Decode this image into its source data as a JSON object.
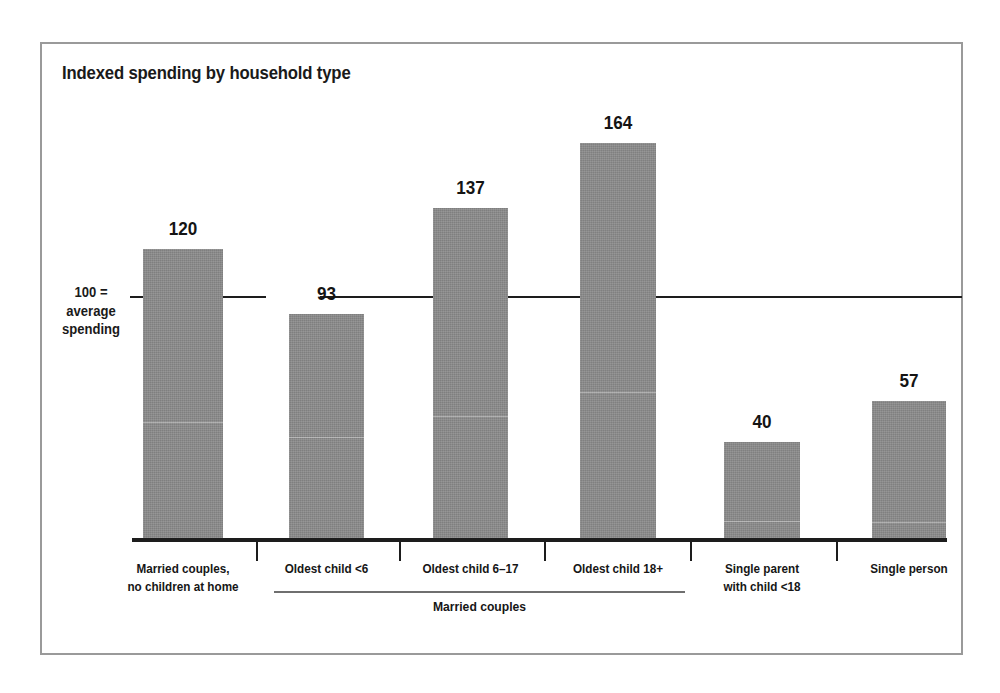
{
  "figure": {
    "title": "Indexed spending by household type",
    "frame_color": "#9a9a9a",
    "background": "#ffffff"
  },
  "axis": {
    "reference_label_line1": "100 =",
    "reference_label_line2": "average",
    "reference_label_line3": "spending",
    "reference_value": 100,
    "baseline_color": "#1d1d1d"
  },
  "group": {
    "label": "Married couples",
    "covers": [
      "Oldest child <6",
      "Oldest child 6–17",
      "Oldest child 18+"
    ]
  },
  "chart_data": {
    "type": "bar",
    "title": "Indexed spending by household type",
    "xlabel": "",
    "ylabel": "",
    "ylim": [
      0,
      175
    ],
    "grid": false,
    "legend": "none",
    "reference_line": {
      "value": 100,
      "label": "100 = average spending"
    },
    "bar_color": "#8a8a8a",
    "categories": [
      "Married couples, no children at home",
      "Oldest child <6",
      "Oldest child 6–17",
      "Oldest child 18+",
      "Single parent with child <18",
      "Single person"
    ],
    "category_label_lines": [
      [
        "Married couples,",
        "no children at home"
      ],
      [
        "Oldest child <6"
      ],
      [
        "Oldest child 6–17"
      ],
      [
        "Oldest child 18+"
      ],
      [
        "Single parent",
        "with child <18"
      ],
      [
        "Single person"
      ]
    ],
    "values": [
      120,
      93,
      137,
      164,
      40,
      57
    ],
    "value_labels": [
      "120",
      "93",
      "137",
      "164",
      "40",
      "57"
    ]
  }
}
